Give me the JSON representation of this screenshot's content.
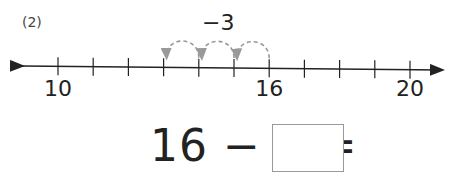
{
  "problem_number": "(2)",
  "step_label": "−3",
  "number_line": {
    "start": 10,
    "end": 21,
    "labels": [
      {
        "value": 10,
        "text": "10"
      },
      {
        "value": 16,
        "text": "16"
      },
      {
        "value": 20,
        "text": "20"
      }
    ],
    "jumps": [
      [
        16,
        15
      ],
      [
        15,
        14
      ],
      [
        14,
        13
      ]
    ],
    "arc_color": "#999999"
  },
  "equation": {
    "text": "16 − 3 =",
    "answer": ""
  }
}
